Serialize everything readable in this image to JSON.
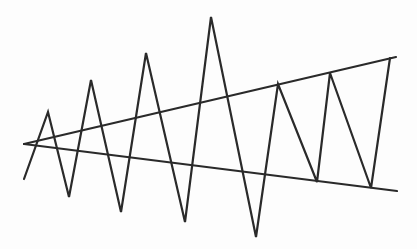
{
  "diagram": {
    "description": "Expanding triangle (broadening wedge) pattern with zigzag price-like line",
    "colors": {
      "background": "#fdfdfd",
      "stroke": "#2a2a2a"
    },
    "stroke_width": 2.2,
    "upper_line": {
      "from": [
        24,
        144
      ],
      "to": [
        396,
        57
      ]
    },
    "lower_line": {
      "from": [
        24,
        144
      ],
      "to": [
        397,
        191
      ]
    },
    "zigzag": [
      [
        24,
        179
      ],
      [
        48,
        112
      ],
      [
        69,
        197
      ],
      [
        91,
        80
      ],
      [
        121,
        212
      ],
      [
        146,
        53
      ],
      [
        185,
        222
      ],
      [
        211,
        17
      ],
      [
        256,
        237
      ],
      [
        278,
        84
      ],
      [
        317,
        182
      ],
      [
        330,
        73
      ],
      [
        371,
        188
      ],
      [
        390,
        58
      ]
    ]
  }
}
